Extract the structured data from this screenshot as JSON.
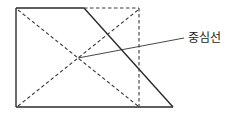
{
  "diagram": {
    "label": "중심선",
    "colors": {
      "line": "#2a2a2a",
      "background": "#ffffff"
    }
  }
}
